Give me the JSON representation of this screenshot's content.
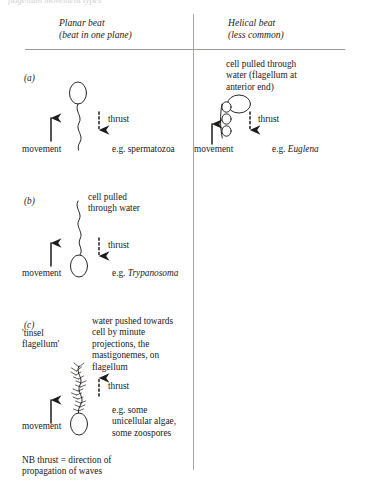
{
  "figure": {
    "ghost_top": "flagellum movement types",
    "columns": [
      {
        "title": "Planar beat",
        "subtitle": "(beat in one plane)"
      },
      {
        "title": "Helical beat",
        "subtitle": "(less common)"
      }
    ],
    "footnote": "NB thrust = direction of\npropagation of waves",
    "colors": {
      "ink": "#20201e",
      "rule": "#9a9a95",
      "background": "#ffffff"
    }
  },
  "rows": {
    "a": {
      "label": "(a)",
      "planar": {
        "movement_label": "movement",
        "thrust_label": "thrust",
        "thrust_direction": "down",
        "example": "e.g. spermatozoa",
        "example_italic": ""
      },
      "helical": {
        "note": "cell pulled through\nwater (flagellum at\nanterior end)",
        "movement_label": "movement",
        "thrust_label": "thrust",
        "thrust_direction": "down",
        "example": "e.g. ",
        "example_italic": "Euglena"
      }
    },
    "b": {
      "label": "(b)",
      "planar": {
        "note": "cell pulled\nthrough water",
        "movement_label": "movement",
        "thrust_label": "thrust",
        "thrust_direction": "down",
        "example": "e.g. ",
        "example_italic": "Trypanosoma"
      }
    },
    "c": {
      "label": "(c)",
      "planar": {
        "flagellum_name": "'tinsel\nflagellum'",
        "note": "water pushed towards\ncell by minute\nprojections, the\nmastigonemes, on\nflagellum",
        "movement_label": "movement",
        "thrust_label": "thrust",
        "thrust_direction": "up",
        "example": "e.g. some\nunicellular algae,\nsome zoospores"
      }
    }
  }
}
